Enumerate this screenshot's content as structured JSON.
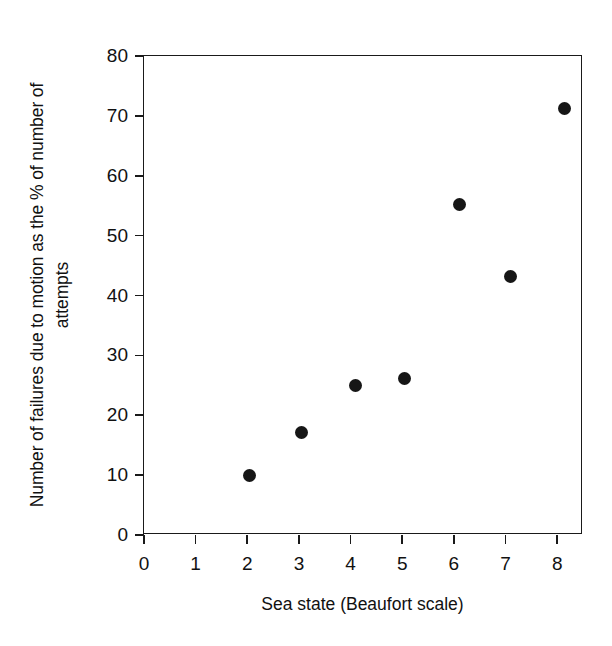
{
  "chart_data": {
    "type": "scatter",
    "title": "",
    "xlabel": "Sea state (Beaufort scale)",
    "ylabel": "Number of failures due to motion as the % of number of attempts",
    "xlim": [
      0,
      8.5
    ],
    "ylim": [
      0,
      80
    ],
    "xticks": [
      0,
      1,
      2,
      3,
      4,
      5,
      6,
      7,
      8
    ],
    "xtick_labels": [
      "0",
      "1",
      "2",
      "3",
      "4",
      "5",
      "6",
      "7",
      "8"
    ],
    "yticks": [
      0,
      10,
      20,
      30,
      40,
      50,
      60,
      70,
      80
    ],
    "ytick_labels": [
      "0",
      "10",
      "20",
      "30",
      "40",
      "50",
      "60",
      "70",
      "80"
    ],
    "grid": false,
    "legend": null,
    "marker": "filled-circle",
    "marker_color": "#161616",
    "x": [
      2.05,
      3.05,
      4.1,
      5.05,
      6.1,
      7.1,
      8.15
    ],
    "y": [
      10,
      17.2,
      25,
      26.2,
      55.2,
      43.2,
      71.2
    ],
    "points": [
      {
        "x": 2.05,
        "y": 10
      },
      {
        "x": 3.05,
        "y": 17.2
      },
      {
        "x": 4.1,
        "y": 25
      },
      {
        "x": 5.05,
        "y": 26.2
      },
      {
        "x": 6.1,
        "y": 55.2
      },
      {
        "x": 7.1,
        "y": 43.2
      },
      {
        "x": 8.15,
        "y": 71.2
      }
    ],
    "frame_color": "#1a1a1a",
    "background": "#ffffff"
  }
}
